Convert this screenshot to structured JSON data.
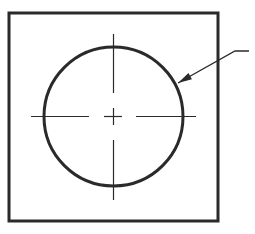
{
  "drawing": {
    "type": "engineering-drawing",
    "description": "Square plate with circular feature, center lines, and leader arrow",
    "colors": {
      "background": "#ffffff",
      "outline": "#2a2a2a",
      "centerline": "#2a2a2a"
    },
    "square": {
      "x": 9,
      "y": 13,
      "width": 209,
      "height": 208,
      "stroke_width": 3
    },
    "circle": {
      "cx": 113.5,
      "cy": 116.5,
      "r": 69.5,
      "stroke_width": 3
    },
    "centerlines": {
      "horizontal_y": 116.5,
      "vertical_x": 113.5,
      "stroke_width": 1.2,
      "horizontal_segments": [
        [
          31,
          89
        ],
        [
          104,
          122
        ],
        [
          136,
          196
        ]
      ],
      "vertical_segments": [
        [
          34,
          93
        ],
        [
          108,
          125
        ],
        [
          140,
          200
        ]
      ]
    },
    "leader": {
      "shelf": [
        [
          249,
          51
        ],
        [
          235,
          51
        ]
      ],
      "line_to_tip": [
        [
          235,
          51
        ],
        [
          178,
          83
        ]
      ],
      "arrow_tip": [
        178,
        83
      ],
      "stroke_width": 1.3
    }
  }
}
